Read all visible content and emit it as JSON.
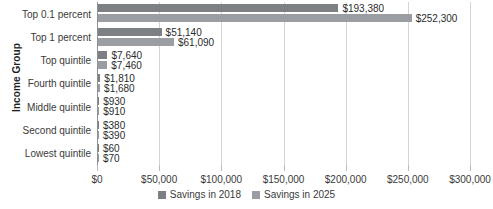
{
  "chart_data": {
    "type": "bar",
    "orientation": "horizontal",
    "title": "",
    "xlabel": "",
    "ylabel": "Income Group",
    "xlim": [
      0,
      300000
    ],
    "xticks": [
      0,
      50000,
      100000,
      150000,
      200000,
      250000,
      300000
    ],
    "xtick_labels": [
      "$0",
      "$50,000",
      "$100,000",
      "$150,000",
      "$200,000",
      "$250,000",
      "$300,000"
    ],
    "grid": true,
    "legend_position": "bottom",
    "categories": [
      "Top 0.1 percent",
      "Top 1 percent",
      "Top quintile",
      "Fourth quintile",
      "Middle quintile",
      "Second quintile",
      "Lowest quintile"
    ],
    "series": [
      {
        "name": "Savings in 2018",
        "color": "#7c7f83",
        "values": [
          193380,
          51140,
          7640,
          1810,
          930,
          380,
          60
        ],
        "labels": [
          "$193,380",
          "$51,140",
          "$7,640",
          "$1,810",
          "$930",
          "$380",
          "$60"
        ]
      },
      {
        "name": "Savings in 2025",
        "color": "#9a9da1",
        "values": [
          252300,
          61090,
          7460,
          1680,
          910,
          390,
          70
        ],
        "labels": [
          "$252,300",
          "$61,090",
          "$7,460",
          "$1,680",
          "$910",
          "$390",
          "$70"
        ]
      }
    ]
  },
  "legend": {
    "items": [
      {
        "label": "Savings in 2018",
        "color": "#7c7f83"
      },
      {
        "label": "Savings in 2025",
        "color": "#9a9da1"
      }
    ]
  },
  "axes": {
    "y_title": "Income Group"
  }
}
